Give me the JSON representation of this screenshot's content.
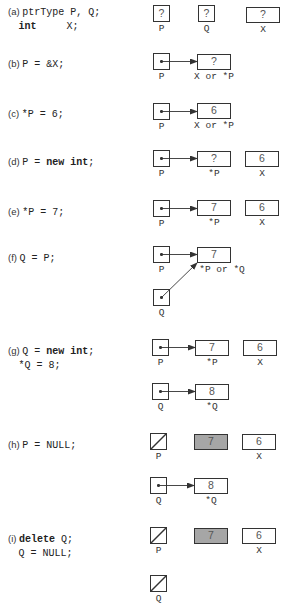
{
  "steps": [
    {
      "id": "a",
      "label": "(a)",
      "code": [
        "ptrType P, Q;",
        "int     X;"
      ],
      "boxes": {
        "P": "?",
        "Q": "?",
        "X": "?"
      },
      "names": {
        "P": "P",
        "Q": "Q",
        "X": "X"
      }
    },
    {
      "id": "b",
      "label": "(b)",
      "code": [
        "P = &X;"
      ],
      "boxes": {
        "target": "?"
      },
      "names": {
        "P": "P",
        "target": "X or *P"
      }
    },
    {
      "id": "c",
      "label": "(c)",
      "code": [
        "*P = 6;"
      ],
      "boxes": {
        "target": "6"
      },
      "names": {
        "P": "P",
        "target": "X or *P"
      }
    },
    {
      "id": "d",
      "label": "(d)",
      "code": [
        "P = new int;"
      ],
      "boxes": {
        "target": "?",
        "X": "6"
      },
      "names": {
        "P": "P",
        "target": "*P",
        "X": "X"
      }
    },
    {
      "id": "e",
      "label": "(e)",
      "code": [
        "*P = 7;"
      ],
      "boxes": {
        "target": "7",
        "X": "6"
      },
      "names": {
        "P": "P",
        "target": "*P",
        "X": "X"
      }
    },
    {
      "id": "f",
      "label": "(f)",
      "code": [
        "Q = P;"
      ],
      "boxes": {
        "target": "7"
      },
      "names": {
        "P": "P",
        "target": "*P or *Q",
        "Q": "Q"
      }
    },
    {
      "id": "g",
      "label": "(g)",
      "code": [
        "Q = new int;",
        "*Q = 8;"
      ],
      "boxes": {
        "targetP": "7",
        "X": "6",
        "targetQ": "8"
      },
      "names": {
        "P": "P",
        "targetP": "*P",
        "X": "X",
        "Q": "Q",
        "targetQ": "*Q"
      }
    },
    {
      "id": "h",
      "label": "(h)",
      "code": [
        "P = NULL;"
      ],
      "boxes": {
        "orphan": "7",
        "X": "6",
        "targetQ": "8"
      },
      "names": {
        "P": "P",
        "X": "X",
        "Q": "Q",
        "targetQ": "*Q"
      }
    },
    {
      "id": "i",
      "label": "(i)",
      "code": [
        "delete Q;",
        "Q = NULL;"
      ],
      "boxes": {
        "orphan": "7",
        "X": "6"
      },
      "names": {
        "P": "P",
        "X": "X",
        "Q": "Q"
      }
    }
  ],
  "colors": {
    "stroke": "#333333",
    "deallocated": "#a6a6a6"
  }
}
